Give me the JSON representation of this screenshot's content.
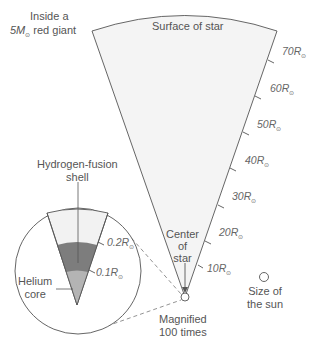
{
  "diagram": {
    "title_line1": "Inside a",
    "title_mass": "5M",
    "title_sun_symbol": "⊙",
    "title_line2_suffix": " red giant",
    "surface_label": "Surface of star",
    "center_label_line1": "Center",
    "center_label_line2": "of",
    "center_label_line3": "star",
    "magnified_line1": "Magnified",
    "magnified_line2": "100 times",
    "sun_label_line1": "Size of",
    "sun_label_line2": "the sun",
    "shell_label_line1": "Hydrogen-fusion",
    "shell_label_line2": "shell",
    "core_label_line1": "Helium",
    "core_label_line2": "core",
    "radius_ticks": [
      {
        "value": "10R",
        "sub": "⊙"
      },
      {
        "value": "20R",
        "sub": "⊙"
      },
      {
        "value": "30R",
        "sub": "⊙"
      },
      {
        "value": "40R",
        "sub": "⊙"
      },
      {
        "value": "50R",
        "sub": "⊙"
      },
      {
        "value": "60R",
        "sub": "⊙"
      },
      {
        "value": "70R",
        "sub": "⊙"
      }
    ],
    "inset_ticks": [
      {
        "value": "0.1R",
        "sub": "⊙"
      },
      {
        "value": "0.2R",
        "sub": "⊙"
      }
    ],
    "colors": {
      "wedge_fill": "#f4f4f4",
      "shell_fill": "#7d7d7d",
      "core_fill": "#b4b4b4",
      "envelope_fill": "#f2f2f2",
      "line": "#555555"
    }
  }
}
